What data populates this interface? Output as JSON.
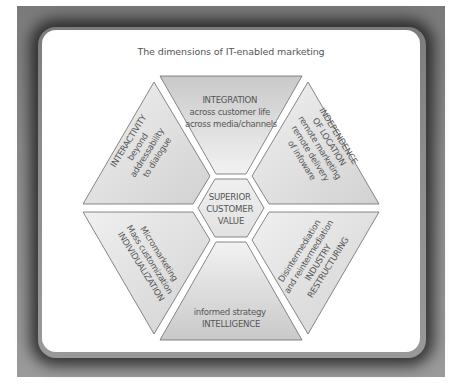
{
  "title": "The dimensions of IT-enabled marketing",
  "center": {
    "lines": [
      "SUPERIOR",
      "CUSTOMER",
      "VALUE"
    ]
  },
  "segments": [
    {
      "position": "top",
      "lines": [
        "INTEGRATION",
        "across customer life",
        "across media/channels"
      ]
    },
    {
      "position": "upper-right",
      "lines": [
        "INDEPENDENCE",
        "OF LOCATION",
        "remote marketing",
        "remote delivery",
        "of infoware"
      ]
    },
    {
      "position": "lower-right",
      "lines": [
        "Disintermediation",
        "and reintermediation",
        "INDUSTRY",
        "RESTRUCTURING"
      ]
    },
    {
      "position": "bottom",
      "lines": [
        "informed strategy",
        "INTELLIGENCE"
      ]
    },
    {
      "position": "lower-left",
      "lines": [
        "Micromarketing",
        "Mass customization",
        "INDIVIDUALIZATION"
      ]
    },
    {
      "position": "upper-left",
      "lines": [
        "INTERACTIVITY",
        "beyond",
        "addressability",
        "to dialogue"
      ]
    }
  ],
  "colors": {
    "frame": "#8a8a8a",
    "panel": "#ffffff",
    "segment_fill": "#e4e4e4",
    "stroke": "#666666",
    "text": "#555555"
  }
}
